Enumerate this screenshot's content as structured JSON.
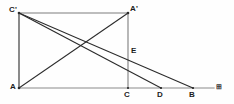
{
  "figure": {
    "background_color": "#fefefe",
    "line_color": "#2b2b2b",
    "axis_color": "#8a8a8a",
    "canvas": {
      "width": 234,
      "height": 104
    },
    "points": [
      {
        "id": "A",
        "label": "A",
        "x": 19,
        "y": 88,
        "label_x": 10,
        "label_y": 82
      },
      {
        "id": "Cprime",
        "label": "C'",
        "x": 19,
        "y": 13,
        "label_x": 9,
        "label_y": 5
      },
      {
        "id": "Aprime",
        "label": "A'",
        "x": 128,
        "y": 13,
        "label_x": 130,
        "label_y": 4
      },
      {
        "id": "C",
        "label": "C",
        "x": 128,
        "y": 88,
        "label_x": 124,
        "label_y": 90
      },
      {
        "id": "D",
        "label": "D",
        "x": 161,
        "y": 88,
        "label_x": 157,
        "label_y": 90
      },
      {
        "id": "B",
        "label": "B",
        "x": 193,
        "y": 88,
        "label_x": 189,
        "label_y": 90
      },
      {
        "id": "E",
        "label": "E",
        "x": 128,
        "y": 53,
        "label_x": 131,
        "label_y": 46
      }
    ],
    "segments": [
      {
        "name": "left-side-A-Cprime",
        "from": "A",
        "to": "Cprime",
        "style": "solid"
      },
      {
        "name": "top-side-Cprime-Aprime",
        "from": "Cprime",
        "to": "Aprime",
        "style": "solid"
      },
      {
        "name": "right-side-Aprime-C",
        "from": "Aprime",
        "to": "C",
        "style": "solid"
      },
      {
        "name": "diagonal-A-Aprime",
        "from": "A",
        "to": "Aprime",
        "style": "solid"
      },
      {
        "name": "ray-Cprime-D",
        "from": "Cprime",
        "to": "D",
        "style": "solid"
      },
      {
        "name": "ray-Cprime-B",
        "from": "Cprime",
        "to": "B",
        "style": "solid"
      }
    ],
    "baseline": {
      "name": "baseline-axis",
      "from_x": 19,
      "to_x": 214,
      "y": 88,
      "end_marker": "⊞"
    }
  }
}
